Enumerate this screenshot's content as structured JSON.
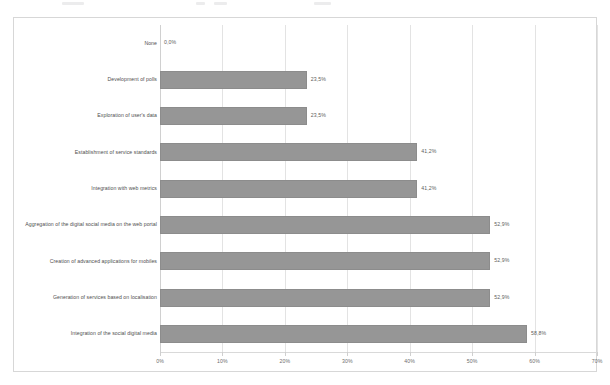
{
  "chart_data": {
    "type": "bar",
    "orientation": "horizontal",
    "title": "",
    "xlabel": "",
    "ylabel": "",
    "xlim": [
      0,
      70
    ],
    "grid": true,
    "legend": "none",
    "decimal_separator": ",",
    "value_suffix": "%",
    "categories": [
      "None",
      "Development of polls",
      "Exploration of user's data",
      "Establishment of service standards",
      "Integration with web metrics",
      "Aggregation of the digital social media on the web portal",
      "Creation of advanced applications for mobiles",
      "Generation of services based on localisation",
      "Integration of the social digital media"
    ],
    "values": [
      0.0,
      23.5,
      23.5,
      41.2,
      41.2,
      52.9,
      52.9,
      52.9,
      58.8
    ],
    "value_labels": [
      "0,0%",
      "23,5%",
      "23,5%",
      "41,2%",
      "41,2%",
      "52,9%",
      "52,9%",
      "52,9%",
      "58,8%"
    ],
    "xticks": [
      0,
      10,
      20,
      30,
      40,
      50,
      60,
      70
    ],
    "xtick_labels": [
      "0%",
      "10%",
      "20%",
      "30%",
      "40%",
      "50%",
      "60%",
      "70%"
    ],
    "colors": {
      "bar_fill": "#969696",
      "bar_stroke": "#8c8c8c",
      "gridline": "#e3e3e3",
      "axis": "#d9d9d9",
      "frame_border": "#d7d7d7",
      "background": "#ffffff",
      "label_text": "#4f4f4f",
      "tick_text": "#6d6d6d"
    }
  }
}
